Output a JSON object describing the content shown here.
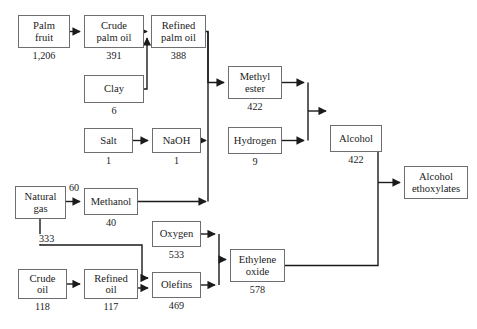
{
  "diagram": {
    "type": "flow-diagram",
    "colors": {
      "background": "#ffffff",
      "box_border": "#6e6e72",
      "edge": "#1b1b1b",
      "text": "#1b1b1b"
    },
    "nodes": [
      {
        "id": "palm_fruit",
        "label_lines": [
          "Palm",
          "fruit"
        ],
        "value": "1,206",
        "x": 18,
        "y": 15,
        "w": 52,
        "h": 33
      },
      {
        "id": "crude_palm_oil",
        "label_lines": [
          "Crude",
          "palm oil"
        ],
        "value": "391",
        "x": 84,
        "y": 15,
        "w": 60,
        "h": 33
      },
      {
        "id": "refined_palm_oil",
        "label_lines": [
          "Refined",
          "palm oil"
        ],
        "value": "388",
        "x": 151,
        "y": 15,
        "w": 55,
        "h": 33
      },
      {
        "id": "clay",
        "label_lines": [
          "Clay"
        ],
        "value": "6",
        "x": 84,
        "y": 75,
        "w": 60,
        "h": 28
      },
      {
        "id": "salt",
        "label_lines": [
          "Salt"
        ],
        "value": "1",
        "x": 84,
        "y": 128,
        "w": 49,
        "h": 25
      },
      {
        "id": "nacl_naoh",
        "label_lines": [
          "NaOH"
        ],
        "value": "1",
        "x": 152,
        "y": 128,
        "w": 49,
        "h": 25
      },
      {
        "id": "methyl_ester",
        "label_lines": [
          "Methyl",
          "ester"
        ],
        "value": "422",
        "x": 228,
        "y": 66,
        "w": 54,
        "h": 33
      },
      {
        "id": "hydrogen",
        "label_lines": [
          "Hydrogen"
        ],
        "value": "9",
        "x": 228,
        "y": 127,
        "w": 54,
        "h": 27
      },
      {
        "id": "alcohol",
        "label_lines": [
          "Alcohol"
        ],
        "value": "422",
        "x": 330,
        "y": 125,
        "w": 52,
        "h": 27
      },
      {
        "id": "alcohol_ethox",
        "label_lines": [
          "Alcohol",
          "ethoxylates"
        ],
        "value": "",
        "x": 404,
        "y": 166,
        "w": 64,
        "h": 33
      },
      {
        "id": "natural_gas",
        "label_lines": [
          "Natural",
          "gas"
        ],
        "value": "",
        "x": 15,
        "y": 186,
        "w": 51,
        "h": 33
      },
      {
        "id": "methanol",
        "label_lines": [
          "Methanol"
        ],
        "value": "40",
        "x": 84,
        "y": 188,
        "w": 54,
        "h": 27
      },
      {
        "id": "oxygen",
        "label_lines": [
          "Oxygen"
        ],
        "value": "533",
        "x": 152,
        "y": 221,
        "w": 49,
        "h": 26
      },
      {
        "id": "olefins",
        "label_lines": [
          "Olefins"
        ],
        "value": "469",
        "x": 152,
        "y": 272,
        "w": 49,
        "h": 26
      },
      {
        "id": "ethylene_oxide",
        "label_lines": [
          "Ethylene",
          "oxide"
        ],
        "value": "578",
        "x": 230,
        "y": 249,
        "w": 55,
        "h": 33
      },
      {
        "id": "crude_oil",
        "label_lines": [
          "Crude",
          "oil"
        ],
        "value": "118",
        "x": 18,
        "y": 269,
        "w": 49,
        "h": 30
      },
      {
        "id": "refined_oil",
        "label_lines": [
          "Refined",
          "oil"
        ],
        "value": "117",
        "x": 84,
        "y": 269,
        "w": 54,
        "h": 30
      }
    ],
    "edge_labels": [
      {
        "id": "ng_to_methanol",
        "text": "60",
        "x": 68,
        "y": 183
      },
      {
        "id": "ng_branch",
        "text": "333",
        "x": 38,
        "y": 234
      }
    ]
  }
}
